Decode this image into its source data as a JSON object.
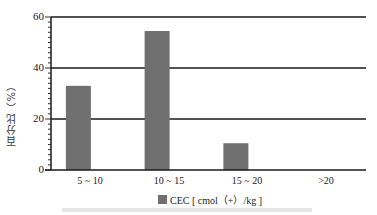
{
  "chart_data": {
    "type": "bar",
    "title": "",
    "categories": [
      "5 ~ 10",
      "10 ~ 15",
      "15 ~ 20",
      ">20"
    ],
    "series": [
      {
        "name": "CEC [ cmol (+) /kg ]",
        "values": [
          33,
          54.5,
          10.5,
          0
        ],
        "color": "#707070"
      }
    ],
    "xlabel": "",
    "ylabel": "百分比（%）",
    "ylim": [
      0,
      60
    ],
    "yticks": [
      0,
      20,
      40,
      60
    ],
    "grid": {
      "horizontal": true,
      "lines_at": [
        20,
        40,
        60
      ]
    },
    "legend_position": "bottom"
  },
  "axis": {
    "ylabel": "百分比（%）",
    "yticks": [
      "0",
      "20",
      "40",
      "60"
    ],
    "xticks": [
      "5 ~ 10",
      "10 ~ 15",
      "15 ~ 20",
      ">20"
    ]
  },
  "legend": {
    "label": "CEC [ cmol（+）/kg ]"
  }
}
